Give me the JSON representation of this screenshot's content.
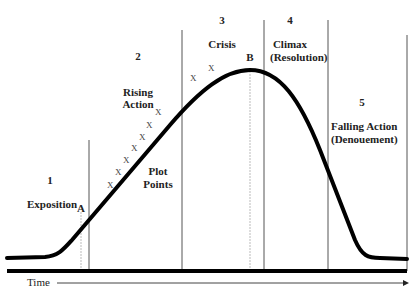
{
  "diagram": {
    "axis": {
      "label": "Time"
    },
    "stages": [
      {
        "number": "1",
        "label": "Exposition"
      },
      {
        "number": "2",
        "label_line1": "Rising",
        "label_line2": "Action"
      },
      {
        "number": "3",
        "label": "Crisis"
      },
      {
        "number": "4",
        "label_line1": "Climax",
        "label_line2": "(Resolution)"
      },
      {
        "number": "5",
        "label_line1": "Falling Action",
        "label_line2": "(Denouement)"
      }
    ],
    "plot_points": {
      "label_line1": "Plot",
      "label_line2": "Points",
      "marker": "X"
    },
    "markers": {
      "a": "A",
      "b": "B"
    },
    "colors": {
      "curve": "#000000",
      "lines": "#555555",
      "guides": "#bbbbbb",
      "text": "#222222"
    }
  }
}
